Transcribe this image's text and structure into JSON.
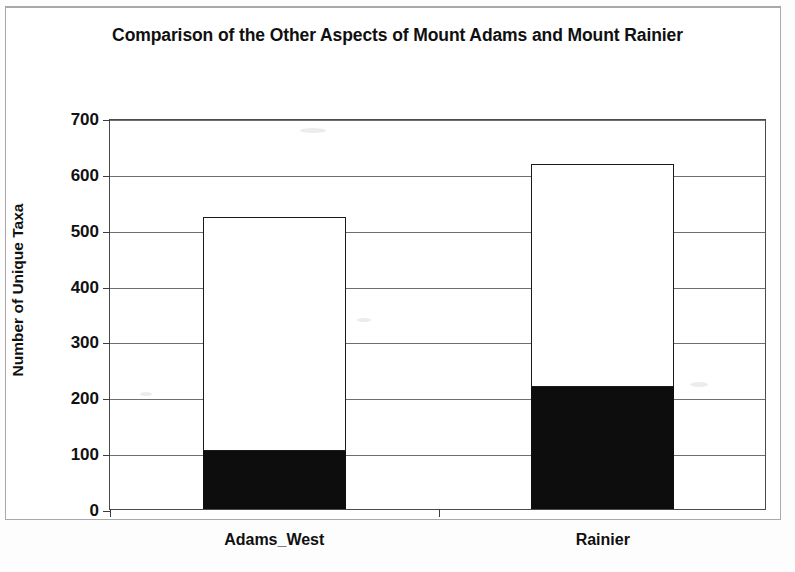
{
  "chart_data": {
    "type": "bar",
    "subtype": "stacked",
    "title": "Comparison of the Other Aspects of Mount Adams and Mount Rainier",
    "xlabel": "",
    "ylabel": "Number of Unique Taxa",
    "categories": [
      "Adams_West",
      "Rainier"
    ],
    "series": [
      {
        "name": "lower-segment",
        "color": "#0d0d0d",
        "values": [
          103,
          219
        ]
      },
      {
        "name": "upper-segment",
        "color": "#ffffff",
        "values": [
          419,
          398
        ]
      }
    ],
    "totals": [
      522,
      617
    ],
    "ylim": [
      0,
      700
    ],
    "yticks": [
      0,
      100,
      200,
      300,
      400,
      500,
      600,
      700
    ],
    "ytick_labels": [
      "0",
      "100",
      "200",
      "300",
      "400",
      "500",
      "600",
      "700"
    ],
    "grid": true,
    "grid_axis": "y",
    "legend": false,
    "legend_position": "none"
  },
  "chart": {
    "title": "Comparison of the Other Aspects of Mount Adams and Mount Rainier",
    "y_axis_title": "Number of Unique Taxa"
  }
}
